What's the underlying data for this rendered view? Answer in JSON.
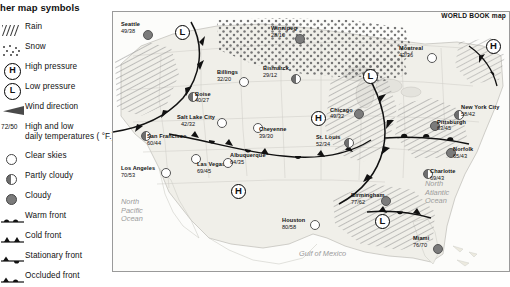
{
  "legend": {
    "title": "her map symbols",
    "items": [
      {
        "label": "Rain",
        "symbol": "rain-hatch"
      },
      {
        "label": "Snow",
        "symbol": "snow-dots"
      },
      {
        "label": "High pressure",
        "symbol": "h-badge"
      },
      {
        "label": "Low pressure",
        "symbol": "l-badge"
      },
      {
        "label": "Wind direction",
        "symbol": "wind-arrow"
      },
      {
        "label": "High and low\ndaily temperatures ( °F.)",
        "symbol": "temp-pair"
      },
      {
        "label": "Clear skies",
        "symbol": "clear-disc"
      },
      {
        "label": "Partly cloudy",
        "symbol": "partly-disc"
      },
      {
        "label": "Cloudy",
        "symbol": "cloudy-disc"
      },
      {
        "label": "Warm front",
        "symbol": "warm-front"
      },
      {
        "label": "Cold front",
        "symbol": "cold-front"
      },
      {
        "label": "Stationary front",
        "symbol": "stationary-front"
      },
      {
        "label": "Occluded front",
        "symbol": "occluded-front"
      }
    ],
    "h_letter": "H",
    "l_letter": "L",
    "temp_sample": "72/50"
  },
  "map": {
    "credit": "WORLD BOOK map",
    "ocean_labels": [
      {
        "text": "North\nPacific\nOcean",
        "x": 8,
        "y": 186
      },
      {
        "text": "North\nAtlantic\nOcean",
        "x": 312,
        "y": 168
      },
      {
        "text": "Gulf of Mexico",
        "x": 186,
        "y": 238
      }
    ],
    "cities": [
      {
        "name": "Seattle",
        "temps": "49/38",
        "sky": "cloudy",
        "x": 30,
        "y": 18,
        "lx": -22,
        "ly": -9,
        "tx": -22,
        "ty": -2,
        "wind": 205
      },
      {
        "name": "Winnipeg",
        "temps": "28/10",
        "sky": "cloudy",
        "x": 182,
        "y": 22,
        "lx": -24,
        "ly": -9,
        "tx": -24,
        "ty": -2,
        "wind": 200
      },
      {
        "name": "Montreal",
        "temps": "43/36",
        "sky": "clear",
        "x": 314,
        "y": 41,
        "lx": -28,
        "ly": -8,
        "tx": -28,
        "ty": -1,
        "wind": 250
      },
      {
        "name": "Billings",
        "temps": "32/20",
        "sky": "clear",
        "x": 126,
        "y": 65,
        "lx": -22,
        "ly": -8,
        "tx": -22,
        "ty": -1,
        "wind": 150
      },
      {
        "name": "Bismarck",
        "temps": "29/12",
        "sky": "partly",
        "x": 178,
        "y": 62,
        "lx": -28,
        "ly": -9,
        "tx": -28,
        "ty": -2,
        "wind": 95
      },
      {
        "name": "Boise",
        "temps": "40/27",
        "sky": "partly",
        "x": 75,
        "y": 80,
        "lx": 7,
        "ly": -1,
        "tx": 7,
        "ty": 5,
        "wind": 200
      },
      {
        "name": "New York City",
        "temps": "58/42",
        "sky": "partly",
        "x": 341,
        "y": 98,
        "lx": 7,
        "ly": -6,
        "tx": 7,
        "ty": 1,
        "wind": 225
      },
      {
        "name": "Chicago",
        "temps": "49/32",
        "sky": "cloudy",
        "x": 241,
        "y": 97,
        "lx": -24,
        "ly": -2,
        "tx": -24,
        "ty": 4,
        "wind": 190
      },
      {
        "name": "Pittsburgh",
        "temps": "63/45",
        "sky": "cloudy",
        "x": 317,
        "y": 109,
        "lx": 7,
        "ly": -2,
        "tx": 7,
        "ty": 4,
        "wind": 225
      },
      {
        "name": "Salt Lake City",
        "temps": "42/32",
        "sky": "clear",
        "x": 104,
        "y": 106,
        "lx": -40,
        "ly": -4,
        "tx": -36,
        "ty": 3,
        "wind": 95
      },
      {
        "name": "Cheyenne",
        "temps": "39/30",
        "sky": "clear",
        "x": 140,
        "y": 111,
        "lx": 6,
        "ly": 3,
        "tx": 6,
        "ty": 10,
        "wind": 95
      },
      {
        "name": "St. Louis",
        "temps": "52/34",
        "sky": "partly",
        "x": 231,
        "y": 126,
        "lx": -28,
        "ly": -4,
        "tx": -28,
        "ty": 3,
        "wind": 95
      },
      {
        "name": "San Francisco",
        "temps": "60/44",
        "sky": "partly",
        "x": 28,
        "y": 119,
        "lx": 6,
        "ly": 2,
        "tx": 6,
        "ty": 9,
        "wind": 255
      },
      {
        "name": "Norfolk",
        "temps": "65/43",
        "sky": "cloudy",
        "x": 333,
        "y": 136,
        "lx": 7,
        "ly": -2,
        "tx": 7,
        "ty": 5,
        "wind": 225
      },
      {
        "name": "Charlotte",
        "temps": "69/43",
        "sky": "partly",
        "x": 310,
        "y": 157,
        "lx": 7,
        "ly": -1,
        "tx": 7,
        "ty": 6,
        "wind": 225
      },
      {
        "name": "Los Angeles",
        "temps": "70/53",
        "sky": "clear",
        "x": 48,
        "y": 156,
        "lx": -40,
        "ly": -3,
        "tx": -40,
        "ty": 4,
        "wind": 245
      },
      {
        "name": "Las Vegas",
        "temps": "69/45",
        "sky": "clear",
        "x": 78,
        "y": 142,
        "lx": 6,
        "ly": 7,
        "tx": 6,
        "ty": 14,
        "wind": 245
      },
      {
        "name": "Albuquerque",
        "temps": "64/35",
        "sky": "clear",
        "x": 110,
        "y": 146,
        "lx": 7,
        "ly": -6,
        "tx": 7,
        "ty": 1,
        "wind": 235
      },
      {
        "name": "Birmingham",
        "temps": "77/62",
        "sky": "cloudy",
        "x": 268,
        "y": 184,
        "lx": -30,
        "ly": -4,
        "tx": -30,
        "ty": 3,
        "wind": 245
      },
      {
        "name": "Houston",
        "temps": "80/58",
        "sky": "clear",
        "x": 197,
        "y": 208,
        "lx": -28,
        "ly": -3,
        "tx": -28,
        "ty": 4,
        "wind": 245
      },
      {
        "name": "Miami",
        "temps": "76/70",
        "sky": "cloudy",
        "x": 320,
        "y": 232,
        "lx": -20,
        "ly": -9,
        "tx": -20,
        "ty": -2,
        "wind": 250
      }
    ],
    "pressures": [
      {
        "letter": "L",
        "x": 62,
        "y": 13
      },
      {
        "letter": "H",
        "x": 373,
        "y": 27
      },
      {
        "letter": "L",
        "x": 250,
        "y": 57
      },
      {
        "letter": "H",
        "x": 198,
        "y": 99
      },
      {
        "letter": "H",
        "x": 118,
        "y": 172
      },
      {
        "letter": "L",
        "x": 262,
        "y": 202
      }
    ]
  }
}
